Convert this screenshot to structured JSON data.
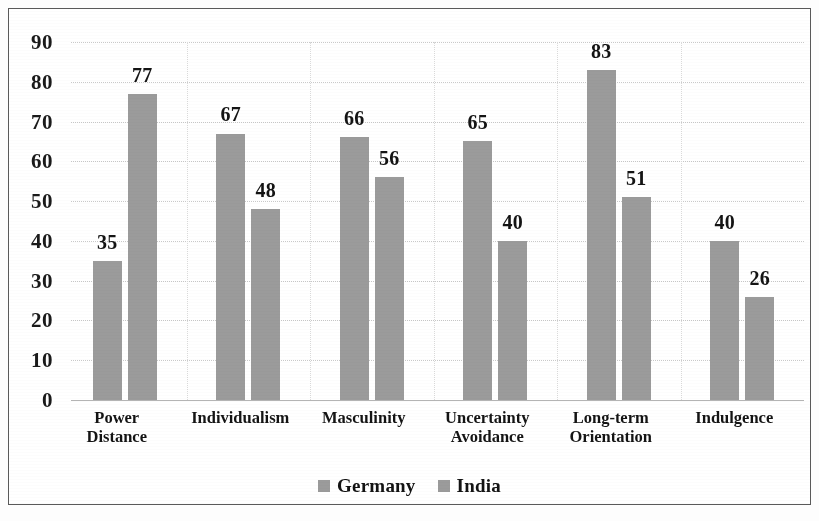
{
  "chart_data": {
    "type": "bar",
    "title": "",
    "subtitle": "",
    "xlabel": "",
    "ylabel": "",
    "ylim": [
      0,
      90
    ],
    "y_ticks": [
      0,
      10,
      20,
      30,
      40,
      50,
      60,
      70,
      80,
      90
    ],
    "grid": true,
    "legend_position": "bottom-center",
    "categories": [
      "Power\nDistance",
      "Individualism",
      "Masculinity",
      "Uncertainty\nAvoidance",
      "Long-term\nOrientation",
      "Indulgence"
    ],
    "series": [
      {
        "name": "Germany",
        "color": "#9b9b9b",
        "values": [
          35,
          67,
          66,
          65,
          83,
          40
        ]
      },
      {
        "name": "India",
        "color": "#9b9b9b",
        "values": [
          77,
          48,
          56,
          40,
          51,
          26
        ]
      }
    ],
    "data_labels": [
      [
        "35",
        "77"
      ],
      [
        "67",
        "48"
      ],
      [
        "66",
        "56"
      ],
      [
        "65",
        "40"
      ],
      [
        "83",
        "51"
      ],
      [
        "40",
        "26"
      ]
    ]
  },
  "legend": {
    "items": [
      {
        "label": "Germany",
        "swatch": "#9b9b9b"
      },
      {
        "label": "India",
        "swatch": "#9b9b9b"
      }
    ]
  },
  "axis": {
    "y_tick_labels": [
      "90",
      "80",
      "70",
      "60",
      "50",
      "40",
      "30",
      "20",
      "10",
      "0"
    ]
  }
}
